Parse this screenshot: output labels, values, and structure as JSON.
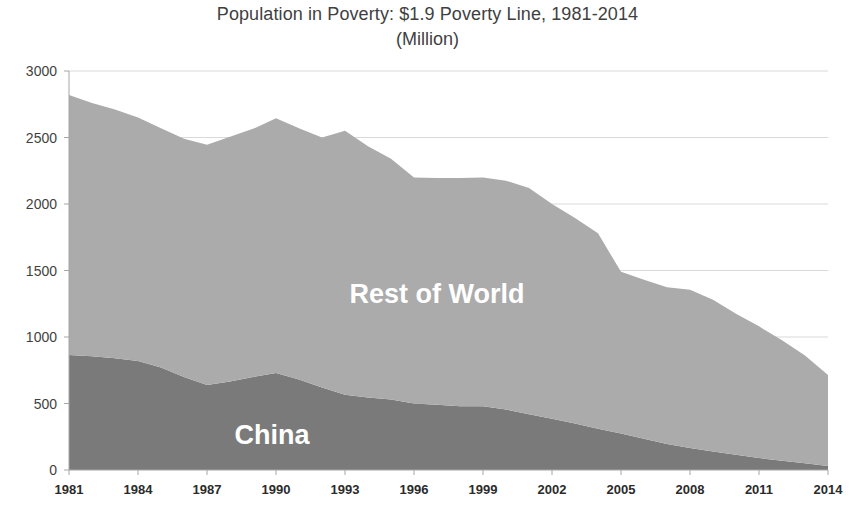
{
  "chart_data": {
    "type": "area",
    "stacked": true,
    "title": "Population in Poverty: $1.9 Poverty Line, 1981-2014",
    "subtitle": "(Million)",
    "xlabel": "",
    "ylabel": "",
    "ylim": [
      0,
      3000
    ],
    "yticks": [
      0,
      500,
      1000,
      1500,
      2000,
      2500,
      3000
    ],
    "ytick_labels": [
      "0",
      "500",
      "1000",
      "1500",
      "2000",
      "2500",
      "3000"
    ],
    "grid": true,
    "legend_position": "inline-labels",
    "xlim": [
      1981,
      2014
    ],
    "xticks": [
      1981,
      1984,
      1987,
      1990,
      1993,
      1996,
      1999,
      2002,
      2005,
      2008,
      2011,
      2014
    ],
    "xtick_labels": [
      "1981",
      "1984",
      "1987",
      "1990",
      "1993",
      "1996",
      "1999",
      "2002",
      "2005",
      "2008",
      "2011",
      "2014"
    ],
    "x": [
      1981,
      1982,
      1983,
      1984,
      1985,
      1986,
      1987,
      1988,
      1989,
      1990,
      1991,
      1992,
      1993,
      1994,
      1995,
      1996,
      1997,
      1998,
      1999,
      2000,
      2001,
      2002,
      2003,
      2004,
      2005,
      2006,
      2007,
      2008,
      2009,
      2010,
      2011,
      2012,
      2013,
      2014
    ],
    "series": [
      {
        "name": "China",
        "color": "#7a7a7a",
        "label_text": "China",
        "values": [
          865,
          855,
          840,
          820,
          770,
          700,
          640,
          665,
          700,
          730,
          680,
          620,
          565,
          545,
          530,
          500,
          490,
          480,
          480,
          455,
          420,
          385,
          350,
          310,
          275,
          235,
          195,
          165,
          140,
          115,
          90,
          70,
          50,
          30
        ]
      },
      {
        "name": "Rest of World",
        "color": "#ababab",
        "label_text": "Rest of World",
        "values": [
          1955,
          1905,
          1870,
          1830,
          1800,
          1790,
          1805,
          1840,
          1865,
          1915,
          1890,
          1880,
          1985,
          1890,
          1810,
          1700,
          1705,
          1715,
          1720,
          1720,
          1700,
          1615,
          1545,
          1470,
          1215,
          1195,
          1180,
          1190,
          1140,
          1060,
          990,
          905,
          810,
          685
        ]
      }
    ],
    "totals": [
      2820,
      2760,
      2710,
      2650,
      2570,
      2490,
      2445,
      2505,
      2565,
      2645,
      2570,
      2500,
      2550,
      2435,
      2340,
      2200,
      2195,
      2195,
      2200,
      2175,
      2120,
      2000,
      1895,
      1780,
      1490,
      1430,
      1375,
      1355,
      1280,
      1175,
      1080,
      975,
      860,
      715
    ]
  },
  "colors": {
    "background": "#ffffff",
    "gridline": "#d9d9d9",
    "axis": "#a6a6a6",
    "text": "#3f3f3f",
    "series_light": "#ababab",
    "series_dark": "#7a7a7a",
    "series_label": "#ffffff"
  }
}
